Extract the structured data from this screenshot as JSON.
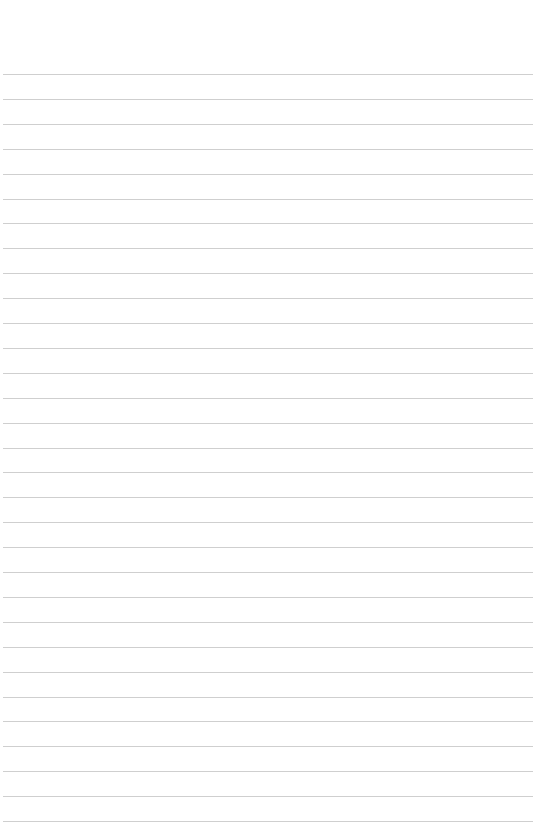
{
  "page": {
    "type": "lined-paper",
    "background": "#ffffff",
    "line_color": "#cfcfcf",
    "line_count": 31,
    "first_line_y": 74,
    "line_spacing": 24.9,
    "line_left": 3,
    "line_width": 530,
    "text": []
  }
}
